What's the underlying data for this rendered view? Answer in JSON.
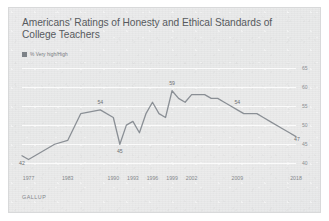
{
  "chart_data": {
    "type": "line",
    "title": "Americans' Ratings of Honesty and Ethical Standards of College Teachers",
    "subtitle": "",
    "xlabel": "",
    "ylabel": "",
    "ylim": [
      38,
      66
    ],
    "yticks": [
      40,
      45,
      50,
      55,
      60,
      65
    ],
    "grid": true,
    "legend_position": "top-left",
    "legend": [
      "% Very high/High"
    ],
    "source": "GALLUP",
    "line_color": "#8a8f95",
    "xticks": [
      1977,
      1983,
      1990,
      1993,
      1996,
      1999,
      2002,
      2009,
      2018
    ],
    "x": [
      1976,
      1977,
      1981,
      1983,
      1985,
      1988,
      1990,
      1991,
      1992,
      1993,
      1994,
      1995,
      1996,
      1997,
      1998,
      1999,
      2000,
      2001,
      2002,
      2003,
      2004,
      2005,
      2006,
      2007,
      2008,
      2009,
      2010,
      2011,
      2012,
      2013,
      2014,
      2016,
      2017,
      2018
    ],
    "values": [
      42,
      41,
      45,
      46,
      53,
      54,
      52,
      45,
      50,
      51,
      48,
      53,
      56,
      53,
      52,
      59,
      57,
      56,
      58,
      58,
      58,
      57,
      57,
      56,
      55,
      54,
      53,
      53,
      53,
      52,
      51,
      49,
      48,
      47
    ],
    "annotations": [
      {
        "label": "42",
        "x": 1976,
        "y": 42
      },
      {
        "label": "54",
        "x": 1988,
        "y": 54
      },
      {
        "label": "45",
        "x": 1991,
        "y": 45
      },
      {
        "label": "59",
        "x": 1999,
        "y": 59
      },
      {
        "label": "54",
        "x": 2009,
        "y": 54
      },
      {
        "label": "47",
        "x": 2018,
        "y": 47
      }
    ]
  },
  "chart": {
    "title": "Americans' Ratings of Honesty and Ethical Standards of College Teachers",
    "legend_label": "% Very high/High",
    "source": "GALLUP"
  }
}
